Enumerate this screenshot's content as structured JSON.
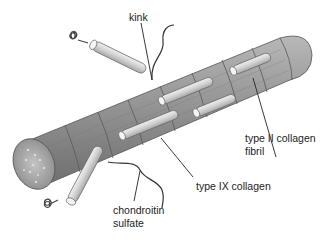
{
  "diagram": {
    "background_color": "#ffffff",
    "fibril_color": "#9a9a9a",
    "rod_color": "#d6d6d6",
    "line_color": "#333333",
    "labels": {
      "kink": "kink",
      "type_ii_line1": "type II collagen",
      "type_ii_line2": "fibril",
      "type_ix": "type IX collagen",
      "chondroitin_line1": "chondroitin",
      "chondroitin_line2": "sulfate"
    }
  }
}
